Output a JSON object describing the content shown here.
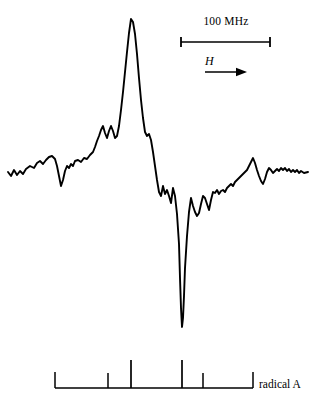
{
  "figure": {
    "background_color": "#ffffff",
    "trace_color": "#000000",
    "width": 317,
    "height": 410
  },
  "scale_bar": {
    "label": "100 MHz",
    "x_start": 181,
    "x_end": 270,
    "y": 42,
    "cap_half_height": 5
  },
  "field_axis": {
    "symbol": "H",
    "arrow_x_start": 205,
    "arrow_x_end": 247,
    "arrow_y": 72,
    "direction": "right"
  },
  "stick_diagram": {
    "label": "radical A",
    "baseline_y": 388,
    "baseline_x_start": 55,
    "baseline_x_end": 253,
    "end_cap_height": 16,
    "ticks": [
      {
        "x": 55,
        "height": 16,
        "kind": "end-cap"
      },
      {
        "x": 108,
        "height": 15,
        "kind": "short"
      },
      {
        "x": 131,
        "height": 28,
        "kind": "tall"
      },
      {
        "x": 182,
        "height": 28,
        "kind": "tall"
      },
      {
        "x": 203,
        "height": 15,
        "kind": "short"
      },
      {
        "x": 253,
        "height": 16,
        "kind": "end-cap"
      }
    ]
  },
  "chart_data": {
    "type": "line",
    "title": "",
    "subtitle": "",
    "xlabel": "H",
    "ylabel": "",
    "grid": false,
    "legend": null,
    "annotations": [
      {
        "text": "100 MHz",
        "role": "scale-bar-label"
      },
      {
        "text": "H",
        "role": "field-sweep-direction"
      },
      {
        "text": "radical A",
        "role": "stick-diagram-label"
      }
    ],
    "axis_note": "Derivative-mode magnetic resonance spectrum; y axis arbitrary intensity, x axis magnetic field increasing to the right. 100 MHz corresponds to 89 px.",
    "xlim": [
      0,
      317
    ],
    "ylim": [
      340,
      10
    ],
    "baseline_y": 173,
    "peak_apex": {
      "x": 131,
      "y": 19
    },
    "trough_minimum": {
      "x": 181,
      "y": 327
    },
    "points": [
      [
        8,
        172
      ],
      [
        11,
        176
      ],
      [
        14,
        170
      ],
      [
        17,
        175
      ],
      [
        20,
        171
      ],
      [
        23,
        174
      ],
      [
        26,
        169
      ],
      [
        30,
        166
      ],
      [
        34,
        168
      ],
      [
        37,
        163
      ],
      [
        40,
        161
      ],
      [
        43,
        164
      ],
      [
        46,
        160
      ],
      [
        49,
        157
      ],
      [
        52,
        156
      ],
      [
        55,
        159
      ],
      [
        57,
        166
      ],
      [
        59,
        176
      ],
      [
        61,
        186
      ],
      [
        63,
        180
      ],
      [
        65,
        171
      ],
      [
        67,
        166
      ],
      [
        69,
        168
      ],
      [
        71,
        164
      ],
      [
        73,
        166
      ],
      [
        75,
        161
      ],
      [
        78,
        160
      ],
      [
        81,
        162
      ],
      [
        84,
        158
      ],
      [
        87,
        159
      ],
      [
        90,
        155
      ],
      [
        93,
        152
      ],
      [
        95,
        147
      ],
      [
        97,
        141
      ],
      [
        99,
        136
      ],
      [
        101,
        130
      ],
      [
        103,
        126
      ],
      [
        105,
        133
      ],
      [
        107,
        138
      ],
      [
        109,
        131
      ],
      [
        111,
        126
      ],
      [
        113,
        131
      ],
      [
        115,
        138
      ],
      [
        117,
        136
      ],
      [
        119,
        126
      ],
      [
        121,
        110
      ],
      [
        123,
        92
      ],
      [
        125,
        72
      ],
      [
        127,
        52
      ],
      [
        129,
        33
      ],
      [
        131,
        19
      ],
      [
        133,
        22
      ],
      [
        135,
        34
      ],
      [
        137,
        54
      ],
      [
        139,
        78
      ],
      [
        141,
        100
      ],
      [
        143,
        118
      ],
      [
        145,
        132
      ],
      [
        147,
        136
      ],
      [
        149,
        134
      ],
      [
        151,
        140
      ],
      [
        153,
        152
      ],
      [
        155,
        166
      ],
      [
        157,
        180
      ],
      [
        159,
        192
      ],
      [
        161,
        196
      ],
      [
        163,
        186
      ],
      [
        165,
        194
      ],
      [
        167,
        190
      ],
      [
        169,
        196
      ],
      [
        171,
        203
      ],
      [
        173,
        188
      ],
      [
        175,
        196
      ],
      [
        177,
        214
      ],
      [
        179,
        244
      ],
      [
        180,
        278
      ],
      [
        181,
        308
      ],
      [
        182,
        327
      ],
      [
        183,
        318
      ],
      [
        184,
        296
      ],
      [
        185,
        268
      ],
      [
        187,
        236
      ],
      [
        189,
        212
      ],
      [
        191,
        198
      ],
      [
        193,
        206
      ],
      [
        195,
        212
      ],
      [
        197,
        216
      ],
      [
        199,
        213
      ],
      [
        201,
        204
      ],
      [
        203,
        196
      ],
      [
        205,
        198
      ],
      [
        207,
        204
      ],
      [
        209,
        210
      ],
      [
        211,
        200
      ],
      [
        213,
        192
      ],
      [
        215,
        193
      ],
      [
        217,
        190
      ],
      [
        219,
        194
      ],
      [
        221,
        191
      ],
      [
        223,
        190
      ],
      [
        225,
        192
      ],
      [
        227,
        188
      ],
      [
        229,
        186
      ],
      [
        231,
        184
      ],
      [
        233,
        186
      ],
      [
        235,
        182
      ],
      [
        237,
        180
      ],
      [
        239,
        178
      ],
      [
        241,
        176
      ],
      [
        243,
        174
      ],
      [
        245,
        172
      ],
      [
        247,
        170
      ],
      [
        249,
        166
      ],
      [
        251,
        162
      ],
      [
        253,
        158
      ],
      [
        255,
        163
      ],
      [
        257,
        170
      ],
      [
        259,
        176
      ],
      [
        261,
        181
      ],
      [
        263,
        184
      ],
      [
        265,
        179
      ],
      [
        267,
        172
      ],
      [
        269,
        168
      ],
      [
        271,
        170
      ],
      [
        273,
        173
      ],
      [
        275,
        171
      ],
      [
        277,
        169
      ],
      [
        279,
        171
      ],
      [
        281,
        168
      ],
      [
        283,
        170
      ],
      [
        285,
        168
      ],
      [
        287,
        171
      ],
      [
        289,
        169
      ],
      [
        291,
        172
      ],
      [
        293,
        170
      ],
      [
        295,
        172
      ],
      [
        297,
        170
      ],
      [
        299,
        173
      ],
      [
        301,
        171
      ],
      [
        304,
        173
      ],
      [
        308,
        172
      ]
    ]
  }
}
